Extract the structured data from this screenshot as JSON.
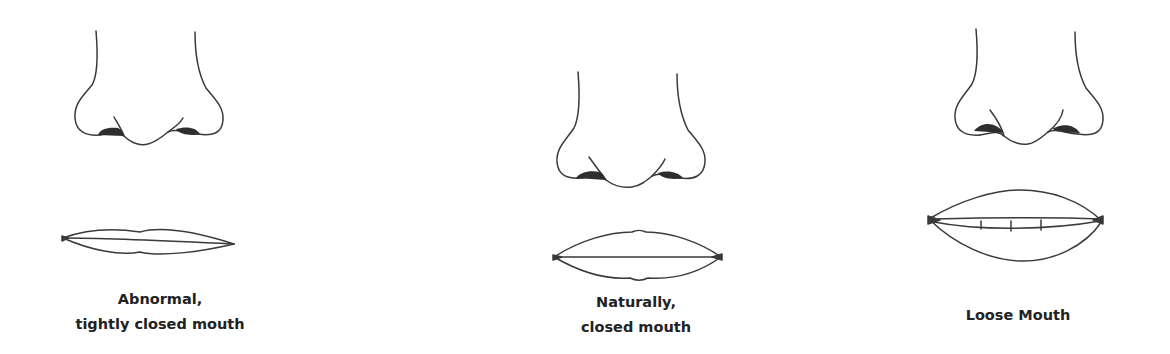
{
  "figure": {
    "colors": {
      "stroke": "#3a3a3a",
      "nostril_fill": "#2e2e2e",
      "text": "#222222",
      "background": "#ffffff"
    },
    "panels": [
      {
        "id": "abnormal",
        "caption_lines": [
          "Abnormal,",
          "tightly closed mouth"
        ]
      },
      {
        "id": "natural",
        "caption_lines": [
          "Naturally,",
          "closed mouth"
        ]
      },
      {
        "id": "loose",
        "caption_lines": [
          "Loose Mouth"
        ]
      }
    ]
  }
}
